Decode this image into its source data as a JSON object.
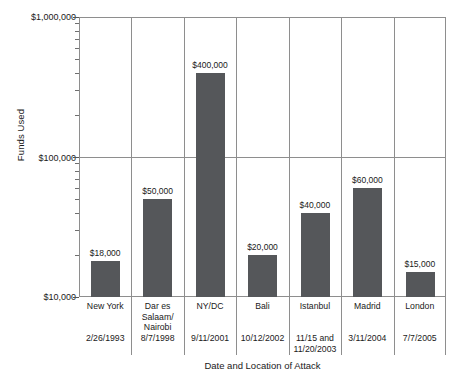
{
  "chart_data": {
    "type": "bar",
    "title": "",
    "xlabel": "Date and Location of Attack",
    "ylabel": "Funds Used",
    "yscale": "log",
    "ylim": [
      10000,
      1000000
    ],
    "ytick_labels": [
      "$1,000,000",
      "$100,000",
      "$10,000"
    ],
    "ytick_values": [
      1000000,
      100000,
      10000
    ],
    "grid": true,
    "legend": false,
    "categories": [
      "New York",
      "Dar es Salaam/ Nairobi",
      "NY/DC",
      "Bali",
      "Istanbul",
      "Madrid",
      "London"
    ],
    "values": [
      18000,
      50000,
      400000,
      20000,
      40000,
      60000,
      15000
    ],
    "bar_labels": [
      "$18,000",
      "$50,000",
      "$400,000",
      "$20,000",
      "$40,000",
      "$60,000",
      "$15,000"
    ],
    "dates": [
      "2/26/1993",
      "8/7/1998",
      "9/11/2001",
      "10/12/2002",
      "11/15 and 11/20/2003",
      "3/11/2004",
      "7/7/2005"
    ],
    "bar_color": "#55575a",
    "axis_color": "#8e8e8e"
  },
  "columns": [
    {
      "name": "New York",
      "date": "2/26/1993",
      "label": "$18,000",
      "value": 18000
    },
    {
      "name": "Dar es Salaam/ Nairobi",
      "date": "8/7/1998",
      "label": "$50,000",
      "value": 50000
    },
    {
      "name": "NY/DC",
      "date": "9/11/2001",
      "label": "$400,000",
      "value": 400000
    },
    {
      "name": "Bali",
      "date": "10/12/2002",
      "label": "$20,000",
      "value": 20000
    },
    {
      "name": "Istanbul",
      "date": "11/15 and 11/20/2003",
      "label": "$40,000",
      "value": 40000
    },
    {
      "name": "Madrid",
      "date": "3/11/2004",
      "label": "$60,000",
      "value": 60000
    },
    {
      "name": "London",
      "date": "7/7/2005",
      "label": "$15,000",
      "value": 15000
    }
  ],
  "axes": {
    "y_title": "Funds Used",
    "x_title": "Date and Location of Attack",
    "y_top": "$1,000,000",
    "y_mid": "$100,000",
    "y_bottom": "$10,000"
  }
}
